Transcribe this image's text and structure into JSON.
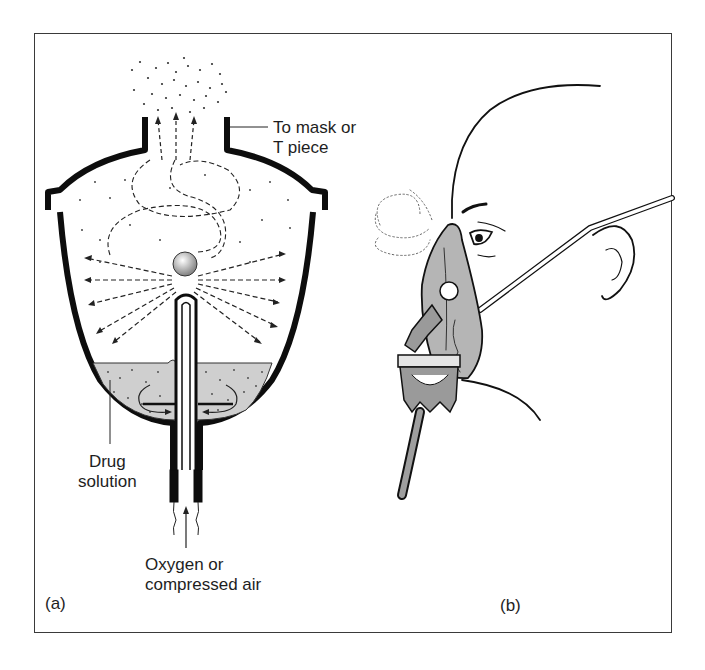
{
  "figure": {
    "panels": [
      {
        "id": "a",
        "panel_label": "(a)",
        "subject": "nebuliser cross-section",
        "labels": {
          "outlet": [
            "To mask or",
            "T piece"
          ],
          "reservoir": [
            "Drug",
            "solution"
          ],
          "inlet": [
            "Oxygen or",
            "compressed air"
          ]
        }
      },
      {
        "id": "b",
        "panel_label": "(b)",
        "subject": "child wearing nebuliser face mask"
      }
    ],
    "colors": {
      "ink": "#111111",
      "liquid_fill": "#cfcfcf",
      "mask_fill": "#b5b5b5",
      "frame": "#3a3a3a",
      "background": "#ffffff"
    }
  }
}
